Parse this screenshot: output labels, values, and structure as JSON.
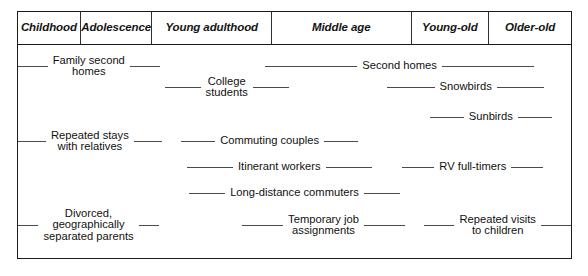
{
  "figure": {
    "type": "diagram",
    "background_color": "#ffffff",
    "border_color": "#1b1b1b",
    "line_color": "#4a4a4a",
    "text_color": "#111111"
  },
  "header": {
    "stages": [
      {
        "label": "Childhood",
        "left_pct": 0.0,
        "width_pct": 11.35
      },
      {
        "label": "Adolescence",
        "left_pct": 11.35,
        "width_pct": 12.97
      },
      {
        "label": "Young adulthood",
        "left_pct": 24.32,
        "width_pct": 21.62
      },
      {
        "label": "Middle age",
        "left_pct": 45.94,
        "width_pct": 25.23
      },
      {
        "label": "Young-old",
        "left_pct": 71.17,
        "width_pct": 14.05
      },
      {
        "label": "Older-old",
        "left_pct": 85.22,
        "width_pct": 14.78
      }
    ]
  },
  "chart_data": {
    "type": "diagram",
    "title": "",
    "xlabel": "",
    "ylabel": "",
    "categories": [
      "Childhood",
      "Adolescence",
      "Young adulthood",
      "Middle age",
      "Young-old",
      "Older-old"
    ],
    "spans": [
      {
        "label": "Family second\nhomes",
        "lines": 2,
        "start_pct": 0.0,
        "end_pct": 25.6,
        "row": 1,
        "stages": [
          "Childhood",
          "Adolescence",
          "Young adulthood"
        ]
      },
      {
        "label": "Second homes",
        "lines": 1,
        "start_pct": 44.7,
        "end_pct": 93.3,
        "row": 1,
        "stages": [
          "Middle age",
          "Young-old",
          "Older-old"
        ]
      },
      {
        "label": "College\nstudents",
        "lines": 2,
        "start_pct": 26.5,
        "end_pct": 49.0,
        "row": 2,
        "stages": [
          "Young adulthood",
          "Middle age"
        ]
      },
      {
        "label": "Snowbirds",
        "lines": 1,
        "start_pct": 66.8,
        "end_pct": 95.1,
        "row": 2,
        "stages": [
          "Young-old",
          "Older-old"
        ]
      },
      {
        "label": "Sunbirds",
        "lines": 1,
        "start_pct": 74.5,
        "end_pct": 96.5,
        "row": 3,
        "stages": [
          "Young-old",
          "Older-old"
        ]
      },
      {
        "label": "Repeated stays\nwith relatives",
        "lines": 2,
        "start_pct": 0.0,
        "end_pct": 26.0,
        "row": 4,
        "stages": [
          "Childhood",
          "Adolescence",
          "Young adulthood"
        ]
      },
      {
        "label": "Commuting couples",
        "lines": 1,
        "start_pct": 29.5,
        "end_pct": 61.5,
        "row": 4,
        "stages": [
          "Young adulthood",
          "Middle age"
        ]
      },
      {
        "label": "Itinerant workers",
        "lines": 1,
        "start_pct": 30.5,
        "end_pct": 64.0,
        "row": 5,
        "stages": [
          "Young adulthood",
          "Middle age"
        ]
      },
      {
        "label": "RV full-timers",
        "lines": 1,
        "start_pct": 69.5,
        "end_pct": 95.0,
        "row": 5,
        "stages": [
          "Young-old",
          "Older-old"
        ]
      },
      {
        "label": "Long-distance commuters",
        "lines": 1,
        "start_pct": 31.0,
        "end_pct": 69.0,
        "row": 6,
        "stages": [
          "Young adulthood",
          "Middle age"
        ]
      },
      {
        "label": "Divorced,\ngeographically\nseparated parents",
        "lines": 3,
        "start_pct": 0.0,
        "end_pct": 25.5,
        "row": 7,
        "stages": [
          "Childhood",
          "Adolescence",
          "Young adulthood"
        ]
      },
      {
        "label": "Temporary job\nassignments",
        "lines": 2,
        "start_pct": 40.5,
        "end_pct": 70.0,
        "row": 7,
        "stages": [
          "Middle age"
        ]
      },
      {
        "label": "Repeated visits\nto children",
        "lines": 2,
        "start_pct": 73.5,
        "end_pct": 100.0,
        "row": 7,
        "stages": [
          "Young-old",
          "Older-old"
        ]
      }
    ]
  }
}
